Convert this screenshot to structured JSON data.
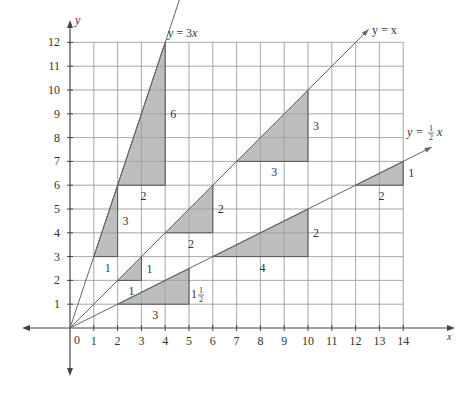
{
  "chart_data": {
    "type": "line",
    "title": "",
    "xlabel": "x",
    "ylabel": "y",
    "xlim": [
      0,
      14
    ],
    "ylim": [
      0,
      12
    ],
    "grid": true,
    "origin_label": "0",
    "x_ticks": [
      "1",
      "2",
      "3",
      "4",
      "5",
      "6",
      "7",
      "8",
      "9",
      "10",
      "11",
      "12",
      "13",
      "14"
    ],
    "y_ticks": [
      "1",
      "2",
      "3",
      "4",
      "5",
      "6",
      "7",
      "8",
      "9",
      "10",
      "11",
      "12"
    ],
    "series": [
      {
        "name": "y = 3x",
        "slope": 3,
        "label": "y = 3x"
      },
      {
        "name": "y = x",
        "slope": 1,
        "label": "y = x"
      },
      {
        "name": "y = 1/2 x",
        "slope": 0.5,
        "label": "y = ½x"
      }
    ],
    "slope_triangles": [
      {
        "line": "y = 3x",
        "from": [
          1,
          3
        ],
        "run": 1,
        "rise": 3,
        "run_label": "1",
        "rise_label": "3"
      },
      {
        "line": "y = 3x",
        "from": [
          2,
          6
        ],
        "run": 2,
        "rise": 6,
        "run_label": "2",
        "rise_label": "6"
      },
      {
        "line": "y = x",
        "from": [
          2,
          2
        ],
        "run": 1,
        "rise": 1,
        "run_label": "1",
        "rise_label": "1"
      },
      {
        "line": "y = x",
        "from": [
          4,
          4
        ],
        "run": 2,
        "rise": 2,
        "run_label": "2",
        "rise_label": "2"
      },
      {
        "line": "y = x",
        "from": [
          7,
          7
        ],
        "run": 3,
        "rise": 3,
        "run_label": "3",
        "rise_label": "3"
      },
      {
        "line": "y = 1/2 x",
        "from": [
          2,
          1
        ],
        "run": 3,
        "rise": 1.5,
        "run_label": "3",
        "rise_label": "1½"
      },
      {
        "line": "y = 1/2 x",
        "from": [
          6,
          3
        ],
        "run": 4,
        "rise": 2,
        "run_label": "4",
        "rise_label": "2"
      },
      {
        "line": "y = 1/2 x",
        "from": [
          12,
          6
        ],
        "run": 2,
        "rise": 1,
        "run_label": "2",
        "rise_label": "1"
      }
    ],
    "colors": {
      "shade": "#bdbdbd",
      "grid": "#c9c9c9",
      "axis": "#444444",
      "line": "#666666"
    }
  },
  "labels": {
    "x_axis": "x",
    "y_axis": "y",
    "origin": "0",
    "line_3x": "y = 3x",
    "line_x": "y = x",
    "line_half_prefix": "y = ",
    "line_half_num": "1",
    "line_half_den": "2",
    "line_half_var": "x",
    "mixed_whole": "1",
    "mixed_num": "1",
    "mixed_den": "2"
  }
}
